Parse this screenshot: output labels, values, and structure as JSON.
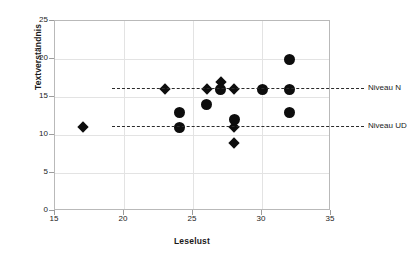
{
  "chart_data": {
    "type": "scatter",
    "title": "",
    "xlabel": "Leselust",
    "ylabel": "Textverständnis",
    "xlim": [
      15,
      35
    ],
    "ylim": [
      0,
      25
    ],
    "xticks": [
      15,
      20,
      25,
      30,
      35
    ],
    "yticks": [
      0,
      5,
      10,
      15,
      20,
      25
    ],
    "grid": true,
    "legend": "none",
    "series": [
      {
        "name": "diamond-group",
        "marker": "diamond",
        "color": "#0d0d0d",
        "points": [
          {
            "x": 17,
            "y": 11
          },
          {
            "x": 23,
            "y": 16
          },
          {
            "x": 26,
            "y": 16
          },
          {
            "x": 27,
            "y": 17
          },
          {
            "x": 28,
            "y": 16
          },
          {
            "x": 28,
            "y": 11
          },
          {
            "x": 28,
            "y": 9
          }
        ]
      },
      {
        "name": "circle-group",
        "marker": "circle",
        "color": "#0d0d0d",
        "points": [
          {
            "x": 24,
            "y": 13
          },
          {
            "x": 24,
            "y": 11
          },
          {
            "x": 26,
            "y": 14
          },
          {
            "x": 27,
            "y": 16
          },
          {
            "x": 28,
            "y": 12
          },
          {
            "x": 30,
            "y": 16
          },
          {
            "x": 32,
            "y": 20
          },
          {
            "x": 32,
            "y": 16
          },
          {
            "x": 32,
            "y": 13
          }
        ]
      }
    ],
    "reference_lines": [
      {
        "label": "Niveau N",
        "y": 16,
        "style": "dashed",
        "color": "#2b2b2b"
      },
      {
        "label": "Niveau UD",
        "y": 11,
        "style": "dashed",
        "color": "#2b2b2b"
      }
    ]
  }
}
